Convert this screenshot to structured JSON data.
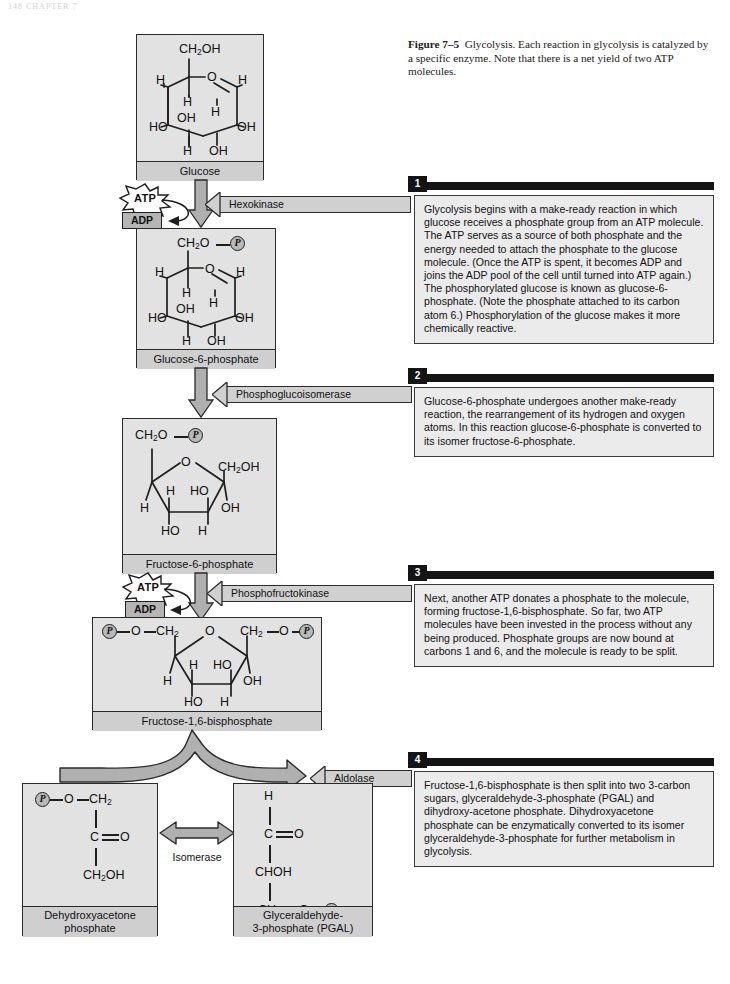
{
  "page": {
    "header_text": "148   CHAPTER 7"
  },
  "caption": {
    "figure_label": "Figure 7–5",
    "text": "Glycolysis. Each reaction in glycolysis is catalyzed by a specific enzyme. Note that there is a net yield of two ATP molecules."
  },
  "molecules": {
    "glucose": {
      "name": "Glucose",
      "atoms": [
        "CH2OH",
        "H",
        "O",
        "H",
        "H",
        "OH",
        "H",
        "HO",
        "OH",
        "H",
        "OH"
      ]
    },
    "g6p": {
      "name": "Glucose-6-phosphate",
      "atoms": [
        "CH2O",
        "P",
        "H",
        "O",
        "H",
        "H",
        "OH",
        "H",
        "HO",
        "OH",
        "H",
        "OH"
      ]
    },
    "f6p": {
      "name": "Fructose-6-phosphate",
      "atoms": [
        "CH2O",
        "P",
        "O",
        "CH2OH",
        "H",
        "HO",
        "H",
        "OH",
        "HO",
        "H"
      ]
    },
    "fbp": {
      "name": "Fructose-1,6-bisphosphate",
      "atoms": [
        "P",
        "O",
        "CH2",
        "O",
        "CH2",
        "O",
        "P",
        "H",
        "HO",
        "H",
        "OH",
        "HO",
        "H"
      ]
    },
    "dhap": {
      "name_line1": "Dehydroxyacetone",
      "name_line2": "phosphate",
      "atoms": [
        "P",
        "O",
        "CH2",
        "C",
        "O",
        "CH2OH"
      ]
    },
    "pgal": {
      "name_line1": "Glyceraldehyde-",
      "name_line2": "3-phosphate (PGAL)",
      "atoms": [
        "H",
        "C",
        "O",
        "CHOH",
        "CH2",
        "O",
        "P"
      ]
    }
  },
  "enzymes": {
    "hexokinase": "Hexokinase",
    "phosphoglucoisomerase": "Phosphoglucoisomerase",
    "phosphofructokinase": "Phosphofructokinase",
    "aldolase": "Aldolase",
    "isomerase": "Isomerase"
  },
  "energy": {
    "atp_label": "ATP",
    "adp_label": "ADP"
  },
  "steps": [
    {
      "number": "1",
      "text": "Glycolysis begins with a make-ready reaction in which glucose receives a phosphate group from an ATP molecule. The ATP serves as a source of both phosphate and the energy needed to attach the phosphate to the glucose molecule. (Once the ATP is spent, it becomes ADP and joins the ADP pool of the cell until turned into ATP again.) The phosphorylated glucose is known as glucose-6-phosphate. (Note the phosphate attached to its carbon atom 6.) Phosphorylation of the glucose makes it more chemically reactive."
    },
    {
      "number": "2",
      "text": "Glucose-6-phosphate undergoes another make-ready reaction, the rearrangement of its hydrogen and oxygen atoms. In this reaction glucose-6-phosphate is converted to its isomer fructose-6-phosphate."
    },
    {
      "number": "3",
      "text": "Next, another ATP donates a phosphate to the molecule, forming fructose-1,6-bisphosphate. So far, two ATP molecules have been invested in the process without any being produced. Phosphate groups are now bound at carbons 1 and 6, and the molecule is ready to be split."
    },
    {
      "number": "4",
      "text": "Fructose-1,6-bisphosphate is then split into two 3-carbon sugars, glyceraldehyde-3-phosphate (PGAL) and dihydroxy-acetone phosphate. Dihydroxyacetone phosphate can be enzymatically converted to its isomer glyceraldehyde-3-phosphate for further metabolism in glycolysis."
    }
  ],
  "colors": {
    "box_fill": "#e2e2e2",
    "label_fill": "#cfcfcf",
    "arrow_fill": "#b0b0b0",
    "panel_fill": "#ebebeb",
    "bar_black": "#141414",
    "stroke": "#1e1e1e"
  }
}
